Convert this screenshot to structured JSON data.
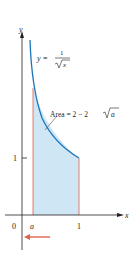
{
  "figure": {
    "axis_x_label": "x",
    "axis_y_label": "y",
    "origin_label": "0",
    "x_tick_a_label": "a",
    "x_tick_1_label": "1",
    "y_tick_1_label": "1",
    "function_lhs": "y =",
    "function_numerator": "1",
    "function_denominator": "x",
    "area_label_prefix": "Area = 2 − 2",
    "area_label_var": "a",
    "colors": {
      "curve": "#1b75bb",
      "fill": "#cfe6f5",
      "boundary": "#e0604a",
      "arrow": "#e0604a",
      "axis": "#231f20"
    }
  }
}
